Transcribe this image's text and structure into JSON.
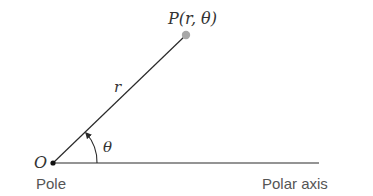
{
  "diagram": {
    "type": "polar-coordinates",
    "colors": {
      "line": "#2a2a2a",
      "point": "#a8a8a8",
      "text_math": "#333333",
      "text_label": "#555555",
      "background": "#ffffff"
    },
    "pole": {
      "x": 53,
      "y": 163,
      "letter": "O",
      "caption": "Pole"
    },
    "point": {
      "x": 186,
      "y": 35,
      "label": "P(r, θ)"
    },
    "radius_label": "r",
    "angle_label": "θ",
    "axis": {
      "x_end": 319,
      "caption": "Polar axis"
    }
  }
}
